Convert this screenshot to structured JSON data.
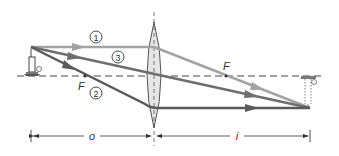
{
  "diagram": {
    "type": "thin converging lens ray diagram",
    "colors": {
      "background": "#ffffff",
      "ray_light": "#a3a3a3",
      "ray_mid": "#6e6e6e",
      "ray_dark": "#5a5a5a",
      "axis": "#444444",
      "lens_fill": "#e6e6e6",
      "lens_stroke": "#555555",
      "text": "#333333"
    },
    "rays": [
      {
        "id": "1",
        "label": "1",
        "description": "parallel ray, refracts through far focal point"
      },
      {
        "id": "2",
        "label": "2",
        "description": "ray through near focal point, exits parallel"
      },
      {
        "id": "3",
        "label": "3",
        "description": "ray through lens center, undeviated"
      }
    ],
    "focal_labels": {
      "near": "F",
      "far": "F"
    },
    "dimensions": {
      "object_distance": "o",
      "image_distance": "i"
    },
    "object": {
      "name": "candle",
      "orientation": "upright"
    },
    "image": {
      "name": "candle",
      "orientation": "inverted"
    }
  }
}
